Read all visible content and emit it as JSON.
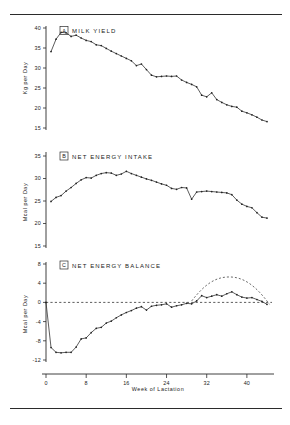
{
  "figure": {
    "name": "lactation-energy-figure",
    "panel_count": 3
  },
  "panels": {
    "a": {
      "tag": "A",
      "title": "MILK  YIELD",
      "ylabel": "Kg per Day"
    },
    "b": {
      "tag": "B",
      "title": "NET  ENERGY  INTAKE",
      "ylabel": "Mcal per Day"
    },
    "c": {
      "tag": "C",
      "title": "NET  ENERGY  BALANCE",
      "ylabel": "Mcal per Day",
      "xlabel": "Week  of  Lactation"
    }
  },
  "chart_data": [
    {
      "type": "line",
      "panel": "A",
      "title": "MILK YIELD",
      "xlabel": "Week of Lactation",
      "ylabel": "Kg per Day",
      "xlim": [
        0,
        45
      ],
      "ylim": [
        15,
        40
      ],
      "yticks": [
        15,
        20,
        25,
        30,
        35,
        40
      ],
      "xticks": [
        0,
        8,
        16,
        24,
        32,
        40
      ],
      "grid": false,
      "markers": true,
      "x": [
        1,
        2,
        3,
        4,
        5,
        6,
        7,
        8,
        9,
        10,
        11,
        12,
        13,
        14,
        15,
        16,
        17,
        18,
        19,
        20,
        21,
        22,
        23,
        24,
        25,
        26,
        27,
        28,
        29,
        30,
        31,
        32,
        33,
        34,
        35,
        36,
        37,
        38,
        39,
        40,
        41,
        42,
        43,
        44
      ],
      "values": [
        34.1,
        37.2,
        38.9,
        38.8,
        37.9,
        38.2,
        37.5,
        36.9,
        36.6,
        35.8,
        35.6,
        34.9,
        34.2,
        33.6,
        33.0,
        32.4,
        31.8,
        30.6,
        31.0,
        29.6,
        28.2,
        27.8,
        27.9,
        28.0,
        27.9,
        28.0,
        27.0,
        26.4,
        25.9,
        25.3,
        23.2,
        22.8,
        23.8,
        22.1,
        21.4,
        20.8,
        20.4,
        20.2,
        19.2,
        18.8,
        18.3,
        17.7,
        17.0,
        16.6
      ]
    },
    {
      "type": "line",
      "panel": "B",
      "title": "NET ENERGY INTAKE",
      "xlabel": "Week of Lactation",
      "ylabel": "Mcal per Day",
      "xlim": [
        0,
        45
      ],
      "ylim": [
        15,
        35
      ],
      "yticks": [
        15,
        20,
        25,
        30,
        35
      ],
      "xticks": [
        0,
        8,
        16,
        24,
        32,
        40
      ],
      "grid": false,
      "markers": true,
      "x": [
        1,
        2,
        3,
        4,
        5,
        6,
        7,
        8,
        9,
        10,
        11,
        12,
        13,
        14,
        15,
        16,
        17,
        18,
        19,
        20,
        21,
        22,
        23,
        24,
        25,
        26,
        27,
        28,
        29,
        30,
        31,
        32,
        33,
        34,
        35,
        36,
        37,
        38,
        39,
        40,
        41,
        42,
        43,
        44
      ],
      "values": [
        24.9,
        25.8,
        26.2,
        27.2,
        28.0,
        28.9,
        29.7,
        30.2,
        30.1,
        30.7,
        31.1,
        31.3,
        31.2,
        30.7,
        31.0,
        31.6,
        31.1,
        30.7,
        30.3,
        29.9,
        29.6,
        29.2,
        28.8,
        28.5,
        27.8,
        27.6,
        28.0,
        27.9,
        25.4,
        27.0,
        27.1,
        27.2,
        27.1,
        27.0,
        26.9,
        26.8,
        26.4,
        25.2,
        24.3,
        23.8,
        23.5,
        22.4,
        21.4,
        21.2
      ]
    },
    {
      "type": "line",
      "panel": "C",
      "title": "NET ENERGY BALANCE",
      "xlabel": "Week of Lactation",
      "ylabel": "Mcal per Day",
      "xlim": [
        0,
        45
      ],
      "ylim": [
        -12,
        8
      ],
      "yticks": [
        -12,
        -8,
        -4,
        0,
        4,
        8
      ],
      "xticks": [
        0,
        8,
        16,
        24,
        32,
        40
      ],
      "grid": false,
      "markers": true,
      "zero_reference_line": 0,
      "x": [
        0,
        1,
        2,
        3,
        4,
        5,
        6,
        7,
        8,
        9,
        10,
        11,
        12,
        13,
        14,
        15,
        16,
        17,
        18,
        19,
        20,
        21,
        22,
        23,
        24,
        25,
        26,
        27,
        28,
        29,
        30,
        31,
        32,
        33,
        34,
        35,
        36,
        37,
        38,
        39,
        40,
        41,
        42,
        43,
        44
      ],
      "values": [
        0.0,
        -9.4,
        -10.4,
        -10.5,
        -10.4,
        -10.4,
        -9.3,
        -7.6,
        -7.4,
        -6.3,
        -5.4,
        -5.2,
        -4.3,
        -3.9,
        -3.2,
        -2.6,
        -2.1,
        -1.7,
        -1.2,
        -0.9,
        -1.6,
        -0.8,
        -0.6,
        -0.5,
        -0.3,
        -1.0,
        -0.7,
        -0.5,
        -0.2,
        -0.3,
        0.3,
        1.4,
        1.0,
        1.3,
        1.6,
        1.3,
        1.8,
        2.2,
        1.6,
        1.1,
        0.9,
        1.0,
        0.6,
        0.2,
        -0.4
      ],
      "annotation_curve": {
        "name": "dashed-arc",
        "style": "dashed",
        "x_start": 29,
        "x_end": 44.5,
        "peak_x": 36.5,
        "peak_y": 5.3,
        "y_start": 0.3,
        "y_end": -0.4
      }
    }
  ]
}
